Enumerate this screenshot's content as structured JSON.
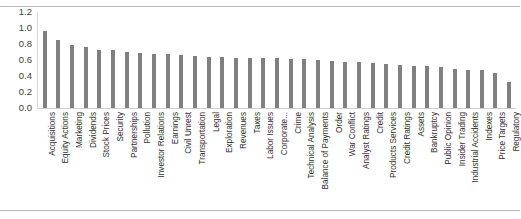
{
  "chart_data": {
    "type": "bar",
    "title": "",
    "subtitle": "",
    "xlabel": "",
    "ylabel": "",
    "ylim": [
      0.0,
      1.2
    ],
    "yticks": [
      "0.0",
      "0.2",
      "0.4",
      "0.6",
      "0.8",
      "1.0",
      "1.2"
    ],
    "ytick_values": [
      0.0,
      0.2,
      0.4,
      0.6,
      0.8,
      1.0,
      1.2
    ],
    "grid": false,
    "legend": null,
    "bar_color": "#808080",
    "categories": [
      "Acquisitions",
      "Equity Actions",
      "Marketing",
      "Dividends",
      "Stock Prices",
      "Security",
      "Partnerships",
      "Pollution",
      "Investor Relations",
      "Earnings",
      "Civil Unrest",
      "Transportation",
      "Legal",
      "Exploration",
      "Revenues",
      "Taxes",
      "Labor Issues",
      "Corporate...",
      "Crime",
      "Technical Analysis",
      "Balance of Payments",
      "Order",
      "War Conflict",
      "Analyst Ratings",
      "Credit",
      "Products Services",
      "Credit Ratings",
      "Assets",
      "Bankruptcy",
      "Public Opinion",
      "Insider Trading",
      "Industrial Accidents",
      "Indexes",
      "Price Targets",
      "Regulatory"
    ],
    "values": [
      0.96,
      0.85,
      0.79,
      0.76,
      0.73,
      0.72,
      0.7,
      0.69,
      0.68,
      0.67,
      0.66,
      0.65,
      0.64,
      0.64,
      0.63,
      0.63,
      0.62,
      0.62,
      0.61,
      0.61,
      0.6,
      0.59,
      0.58,
      0.57,
      0.56,
      0.55,
      0.54,
      0.53,
      0.52,
      0.51,
      0.49,
      0.48,
      0.47,
      0.44,
      0.33
    ]
  }
}
